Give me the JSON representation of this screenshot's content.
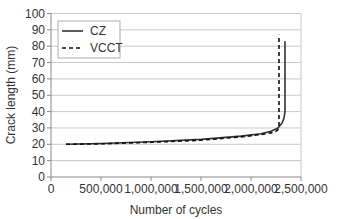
{
  "chart_data": {
    "type": "line",
    "title": "",
    "xlabel": "Number of cycles",
    "ylabel": "Crack length (mm)",
    "xlim": [
      0,
      2500000
    ],
    "ylim": [
      0,
      100
    ],
    "x_ticks": [
      0,
      500000,
      1000000,
      1500000,
      2000000,
      2500000
    ],
    "x_tick_labels": [
      "0",
      "500,000",
      "1,000,000",
      "1,500,000",
      "2,000,000",
      "2,500,000"
    ],
    "y_ticks": [
      0,
      10,
      20,
      30,
      40,
      50,
      60,
      70,
      80,
      90,
      100
    ],
    "y_tick_labels": [
      "0",
      "10",
      "20",
      "30",
      "40",
      "50",
      "60",
      "70",
      "80",
      "90",
      "100"
    ],
    "grid": "horizontal",
    "legend_position": "upper-left-inside",
    "series": [
      {
        "name": "CZ",
        "style": "solid",
        "color": "#333333",
        "x": [
          150000,
          500000,
          1000000,
          1500000,
          1900000,
          2100000,
          2200000,
          2270000,
          2310000,
          2330000,
          2340000,
          2340000
        ],
        "y": [
          20,
          20.5,
          21.5,
          23,
          25,
          26.5,
          28,
          30,
          33,
          36,
          40,
          83
        ]
      },
      {
        "name": "VCCT",
        "style": "dashed",
        "color": "#111111",
        "x": [
          150000,
          500000,
          1000000,
          1500000,
          1900000,
          2100000,
          2200000,
          2250000,
          2270000,
          2280000,
          2280000
        ],
        "y": [
          20,
          20.3,
          21.2,
          22.5,
          24.5,
          26,
          27,
          28,
          29,
          31,
          87
        ]
      }
    ]
  },
  "legend": {
    "items": [
      {
        "label": "CZ",
        "style": "solid"
      },
      {
        "label": "VCCT",
        "style": "dashed"
      }
    ]
  },
  "colors": {
    "grid": "#c8c8c8",
    "axis": "#888888",
    "text": "#333333"
  }
}
